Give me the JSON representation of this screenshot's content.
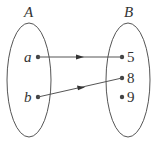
{
  "diagram": {
    "type": "function-mapping",
    "sets": [
      {
        "name": "A",
        "elements": [
          "a",
          "b"
        ]
      },
      {
        "name": "B",
        "elements": [
          "5",
          "8",
          "9"
        ]
      }
    ],
    "mappings": [
      {
        "from": "a",
        "to": "5"
      },
      {
        "from": "b",
        "to": "8"
      }
    ],
    "colors": {
      "stroke": "#555555",
      "text": "#333333",
      "dot": "#444444"
    }
  }
}
